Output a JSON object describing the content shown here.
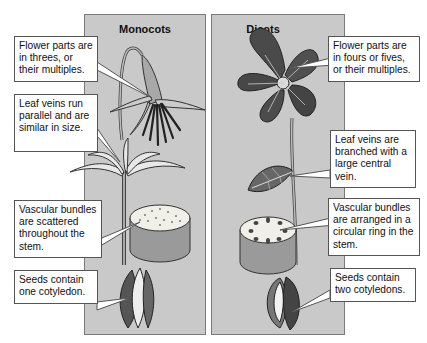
{
  "panels": {
    "monocots": {
      "title": "Monocots",
      "callouts": [
        {
          "text": "Flower parts are in threes, or their multiples."
        },
        {
          "text": "Leaf veins run parallel and are similar in size."
        },
        {
          "text": "Vascular bundles are scattered throughout the stem."
        },
        {
          "text": "Seeds contain one cotyledon."
        }
      ]
    },
    "dicots": {
      "title": "Dicots",
      "callouts": [
        {
          "text": "Flower parts are in fours or fives, or their multiples."
        },
        {
          "text": "Leaf veins are branched with a large central vein."
        },
        {
          "text": "Vascular bundles are arranged in a circular ring in the stem."
        },
        {
          "text": "Seeds contain two cotyledons."
        }
      ]
    }
  },
  "colors": {
    "panel_bg": "#c9c9c9",
    "flower_dark": "#3a3a3a",
    "flower_light": "#b5b5b5"
  }
}
